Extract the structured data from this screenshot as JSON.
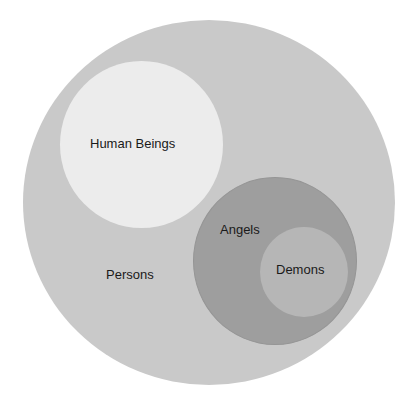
{
  "diagram": {
    "type": "nested-venn",
    "sets": [
      {
        "id": "persons",
        "label": "Persons",
        "color": "#c9c9c9",
        "contains": [
          "human-beings",
          "angels"
        ]
      },
      {
        "id": "human-beings",
        "label": "Human Beings",
        "color": "#ececec",
        "contains": []
      },
      {
        "id": "angels",
        "label": "Angels",
        "color": "#9e9e9e",
        "contains": [
          "demons"
        ]
      },
      {
        "id": "demons",
        "label": "Demons",
        "color": "#b6b6b6",
        "contains": []
      }
    ],
    "text_color": "#1a1a1a"
  }
}
